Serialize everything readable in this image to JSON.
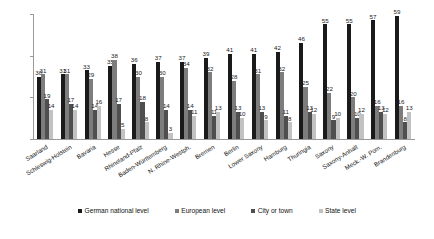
{
  "chart_data": {
    "type": "bar",
    "title": "",
    "subtitle": "",
    "xlabel": "",
    "ylabel": "",
    "ylim": [
      0,
      60
    ],
    "yticks": [
      0,
      20,
      40,
      60
    ],
    "grid": false,
    "legend_position": "bottom",
    "categories": [
      "Saarland",
      "Schleswig-Holstein",
      "Bavaria",
      "Hesse",
      "Rhineland-Pfalz",
      "Baden-Württemberg",
      "N. Rhine-Westph.",
      "Bremen",
      "Berlin",
      "Lower Saxony",
      "Hamburg",
      "Thuringia",
      "Saxony",
      "Saxony-Anhalt",
      "Meck.-W. Pom.",
      "Brandenburg"
    ],
    "series": [
      {
        "name": "German national level",
        "color": "#1a1a1a",
        "values": [
          30,
          31,
          33,
          35,
          36,
          37,
          37,
          39,
          41,
          41,
          42,
          46,
          55,
          55,
          57,
          59
        ]
      },
      {
        "name": "European level",
        "color": "#7d7d7d",
        "values": [
          31,
          31,
          29,
          38,
          30,
          30,
          34,
          32,
          28,
          31,
          32,
          25,
          22,
          20,
          16,
          16
        ]
      },
      {
        "name": "City or town",
        "color": "#4f4f4f",
        "values": [
          19,
          17,
          14,
          17,
          18,
          14,
          14,
          11,
          13,
          13,
          11,
          13,
          9,
          10,
          13,
          8
        ]
      },
      {
        "name": "State level",
        "color": "#c2c2c2",
        "values": [
          14,
          14,
          16,
          5,
          8,
          3,
          11,
          13,
          10,
          9,
          8,
          12,
          10,
          12,
          12,
          13
        ]
      }
    ]
  },
  "legend": {
    "items": [
      "German national level",
      "European level",
      "City or town",
      "State level"
    ]
  }
}
